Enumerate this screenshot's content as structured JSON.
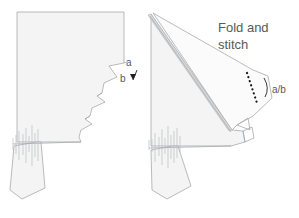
{
  "figure": {
    "background_color": "#ffffff",
    "panel_fill_color": "#f4f4f4",
    "outline_color": "#a7a9ac",
    "label_color": "#58595b",
    "stitch_color": "#1a1a1a"
  },
  "left_panel": {
    "name": "unfolded-pattern-piece",
    "labels": {
      "point_a": "a",
      "point_b": "b"
    },
    "arrow": {
      "name": "fold-direction-arrow",
      "direction": "down"
    }
  },
  "right_panel": {
    "name": "folded-pattern-piece",
    "labels": {
      "instruction": "Fold and",
      "instruction_line2": "stitch",
      "matched_points": "a/b"
    },
    "stitch_line": {
      "name": "dotted-stitch-line",
      "style": "dotted"
    }
  }
}
